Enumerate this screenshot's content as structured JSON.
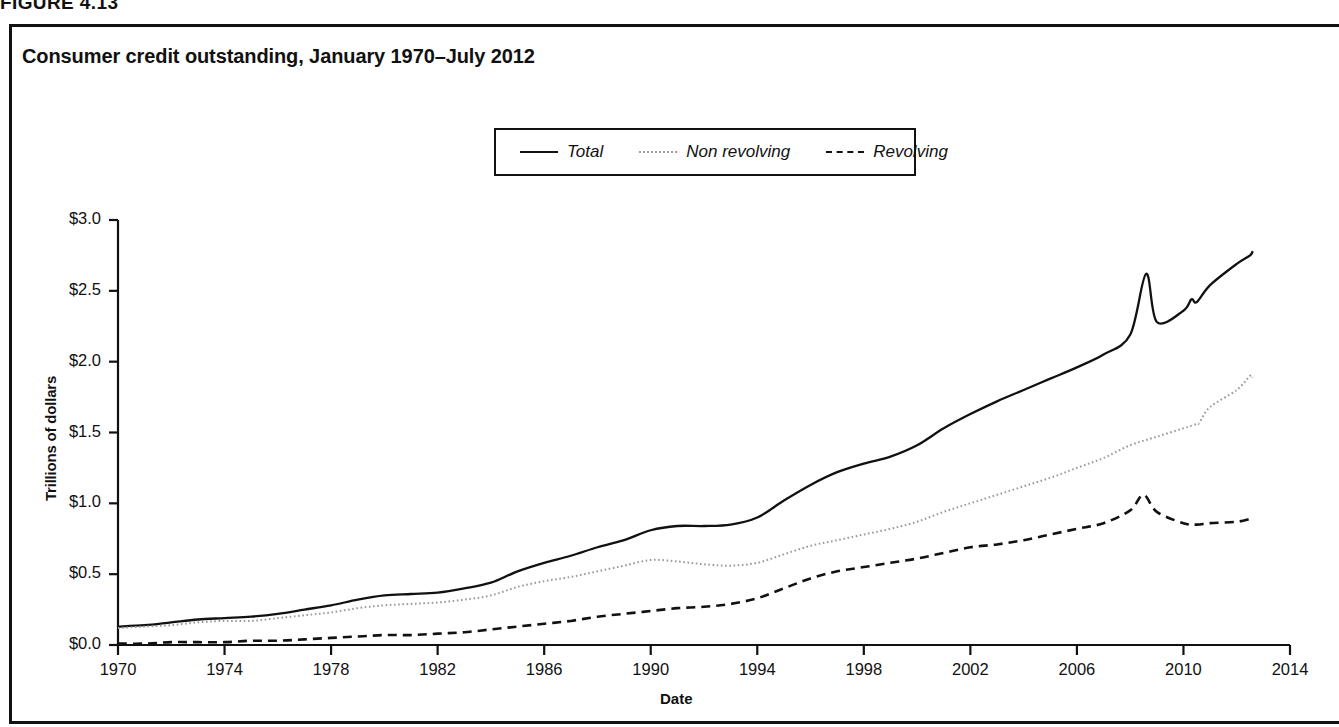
{
  "figure": {
    "number_label": "FIGURE 4.13"
  },
  "chart_title": "Consumer credit outstanding, January 1970–July 2012",
  "axis": {
    "y_label": "Trillions of dollars",
    "x_label": "Date"
  },
  "legend": {
    "items": [
      {
        "label": "Total",
        "style": "solid",
        "color": "#111111"
      },
      {
        "label": "Non revolving",
        "style": "dotted",
        "color": "#9a9a9a"
      },
      {
        "label": "Revolving",
        "style": "dashed",
        "color": "#111111"
      }
    ]
  },
  "colors": {
    "total": "#111111",
    "non_revolving": "#9a9a9a",
    "revolving": "#111111",
    "axis": "#111111",
    "frame": "#111111",
    "background": "#ffffff"
  },
  "chart_data": {
    "type": "line",
    "title": "Consumer credit outstanding, January 1970–July 2012",
    "xlabel": "Date",
    "ylabel": "Trillions of dollars",
    "xlim": [
      1970,
      2014
    ],
    "ylim": [
      0.0,
      3.0
    ],
    "xticks": [
      1970,
      1974,
      1978,
      1982,
      1986,
      1990,
      1994,
      1998,
      2002,
      2006,
      2010,
      2014
    ],
    "xtick_labels": [
      "1970",
      "1974",
      "1978",
      "1982",
      "1986",
      "1990",
      "1994",
      "1998",
      "2002",
      "2006",
      "2010",
      "2014"
    ],
    "yticks": [
      0.0,
      0.5,
      1.0,
      1.5,
      2.0,
      2.5,
      3.0
    ],
    "ytick_labels": [
      "$0.0",
      "$0.5",
      "$1.0",
      "$1.5",
      "$2.0",
      "$2.5",
      "$3.0"
    ],
    "grid": false,
    "legend_position": "upper center",
    "x": [
      1970,
      1971,
      1972,
      1973,
      1974,
      1975,
      1976,
      1977,
      1978,
      1979,
      1980,
      1981,
      1982,
      1983,
      1984,
      1985,
      1986,
      1987,
      1988,
      1989,
      1990,
      1991,
      1992,
      1993,
      1994,
      1995,
      1996,
      1997,
      1998,
      1999,
      2000,
      2001,
      2002,
      2003,
      2004,
      2005,
      2006,
      2007,
      2008,
      2009,
      2010,
      2010.5,
      2011,
      2012,
      2012.6
    ],
    "series": [
      {
        "name": "Total",
        "style": "solid",
        "color": "#111111",
        "values": [
          0.13,
          0.14,
          0.16,
          0.18,
          0.19,
          0.2,
          0.22,
          0.25,
          0.28,
          0.32,
          0.35,
          0.36,
          0.37,
          0.4,
          0.44,
          0.52,
          0.58,
          0.63,
          0.69,
          0.74,
          0.81,
          0.84,
          0.84,
          0.85,
          0.9,
          1.02,
          1.13,
          1.22,
          1.28,
          1.33,
          1.41,
          1.53,
          1.63,
          1.72,
          1.8,
          1.88,
          1.96,
          2.05,
          2.19,
          2.28,
          2.36,
          2.42,
          2.54,
          2.69,
          2.78
        ],
        "annotations": [
          {
            "x": 2008.6,
            "y": 2.62,
            "note": "peak before credit crisis"
          },
          {
            "x": 2010.3,
            "y": 2.44,
            "note": "trough"
          },
          {
            "x": 2012.5,
            "y": 2.75,
            "note": "July 2012 end value"
          }
        ]
      },
      {
        "name": "Non revolving",
        "style": "dotted",
        "color": "#9a9a9a",
        "values": [
          0.12,
          0.13,
          0.14,
          0.16,
          0.17,
          0.17,
          0.19,
          0.21,
          0.23,
          0.26,
          0.28,
          0.29,
          0.3,
          0.32,
          0.35,
          0.41,
          0.45,
          0.48,
          0.52,
          0.56,
          0.6,
          0.59,
          0.57,
          0.56,
          0.58,
          0.64,
          0.7,
          0.74,
          0.78,
          0.82,
          0.87,
          0.94,
          1.0,
          1.06,
          1.12,
          1.18,
          1.25,
          1.32,
          1.41,
          1.47,
          1.53,
          1.56,
          1.68,
          1.8,
          1.89
        ],
        "annotations": [
          {
            "x": 2010.6,
            "y": 1.57,
            "note": "step jump in 2010"
          },
          {
            "x": 2012.5,
            "y": 1.9,
            "note": "July 2012 end value"
          }
        ]
      },
      {
        "name": "Revolving",
        "style": "dashed",
        "color": "#111111",
        "values": [
          0.01,
          0.01,
          0.02,
          0.02,
          0.02,
          0.03,
          0.03,
          0.04,
          0.05,
          0.06,
          0.07,
          0.07,
          0.08,
          0.09,
          0.11,
          0.13,
          0.15,
          0.17,
          0.2,
          0.22,
          0.24,
          0.26,
          0.27,
          0.29,
          0.33,
          0.4,
          0.47,
          0.52,
          0.55,
          0.58,
          0.61,
          0.65,
          0.69,
          0.71,
          0.74,
          0.78,
          0.82,
          0.86,
          0.95,
          0.94,
          0.86,
          0.85,
          0.86,
          0.87,
          0.89
        ],
        "annotations": [
          {
            "x": 2008.5,
            "y": 1.06,
            "note": "peak"
          },
          {
            "x": 2012.5,
            "y": 0.89,
            "note": "July 2012 end value"
          }
        ]
      }
    ]
  }
}
